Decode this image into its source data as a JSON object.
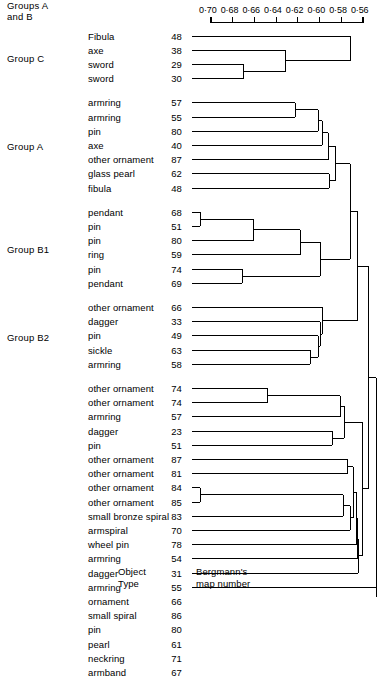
{
  "chart_data": {
    "type": "dendrogram",
    "title": "",
    "xlabel": "",
    "ylabel": "",
    "axis": {
      "position": "top",
      "ticks": [
        "0·70",
        "0·68",
        "0·66",
        "0·64",
        "0·62",
        "0·60",
        "0·58",
        "0·56"
      ],
      "values": [
        0.7,
        0.68,
        0.66,
        0.64,
        0.62,
        0.6,
        0.58,
        0.56
      ],
      "range": [
        0.7,
        0.56
      ],
      "direction": "decreasing-left-to-right",
      "grid": false
    },
    "column_headers": {
      "object_type": "Object\nType",
      "map_number": "Bergmann's\nmap number"
    },
    "group_labels": [
      {
        "text": "Group C",
        "rows": [
          0,
          3
        ]
      },
      {
        "text": "Group A",
        "rows": [
          4,
          10
        ]
      },
      {
        "text": "Group B1",
        "rows": [
          11,
          16
        ]
      },
      {
        "text": "Group B2",
        "rows": [
          17,
          21
        ]
      },
      {
        "text": "Groups A\nand B",
        "rows": [
          22,
          45
        ]
      }
    ],
    "leaves": [
      {
        "type": "Fibula",
        "map": "48"
      },
      {
        "type": "axe",
        "map": "38"
      },
      {
        "type": "sword",
        "map": "29"
      },
      {
        "type": "sword",
        "map": "30"
      },
      {
        "type": "armring",
        "map": "57"
      },
      {
        "type": "armring",
        "map": "55"
      },
      {
        "type": "pin",
        "map": "80"
      },
      {
        "type": "axe",
        "map": "40"
      },
      {
        "type": "other ornament",
        "map": "87"
      },
      {
        "type": "glass pearl",
        "map": "62"
      },
      {
        "type": "fibula",
        "map": "48"
      },
      {
        "type": "pendant",
        "map": "68"
      },
      {
        "type": "pin",
        "map": "51"
      },
      {
        "type": "pin",
        "map": "80"
      },
      {
        "type": "ring",
        "map": "59"
      },
      {
        "type": "pin",
        "map": "74"
      },
      {
        "type": "pendant",
        "map": "69"
      },
      {
        "type": "other ornament",
        "map": "66"
      },
      {
        "type": "dagger",
        "map": "33"
      },
      {
        "type": "pin",
        "map": "49"
      },
      {
        "type": "sickle",
        "map": "63"
      },
      {
        "type": "armring",
        "map": "58"
      },
      {
        "type": "other ornament",
        "map": "74"
      },
      {
        "type": "other ornament",
        "map": "74"
      },
      {
        "type": "armring",
        "map": "57"
      },
      {
        "type": "dagger",
        "map": "23"
      },
      {
        "type": "pin",
        "map": "51"
      },
      {
        "type": "other ornament",
        "map": "87"
      },
      {
        "type": "other ornament",
        "map": "81"
      },
      {
        "type": "other ornament",
        "map": "84"
      },
      {
        "type": "other ornament",
        "map": "85"
      },
      {
        "type": "small bronze spiral",
        "map": "83"
      },
      {
        "type": "armspiral",
        "map": "70"
      },
      {
        "type": "wheel pin",
        "map": "78"
      },
      {
        "type": "armring",
        "map": "54"
      },
      {
        "type": "dagger",
        "map": "31"
      },
      {
        "type": "armring",
        "map": "55"
      },
      {
        "type": "ornament",
        "map": "66"
      },
      {
        "type": "small spiral",
        "map": "86"
      },
      {
        "type": "pin",
        "map": "80"
      },
      {
        "type": "pearl",
        "map": "61"
      },
      {
        "type": "neckring",
        "map": "71"
      },
      {
        "type": "armband",
        "map": "67"
      }
    ],
    "merges": [
      {
        "children": [
          2,
          3
        ],
        "x": 243
      },
      {
        "children": [
          1,
          "m0"
        ],
        "x": 285
      },
      {
        "children": [
          0,
          "m1"
        ],
        "x": 350
      },
      {
        "children": [
          4,
          5
        ],
        "x": 295
      },
      {
        "children": [
          6,
          "m3"
        ],
        "x": 318
      },
      {
        "children": [
          7,
          "m4"
        ],
        "x": 322
      },
      {
        "children": [
          8,
          "m5"
        ],
        "x": 328
      },
      {
        "children": [
          9,
          10
        ],
        "x": 329
      },
      {
        "children": [
          "m6",
          "m7"
        ],
        "x": 335
      },
      {
        "children": [
          11,
          12
        ],
        "x": 200
      },
      {
        "children": [
          13,
          "m9"
        ],
        "x": 253
      },
      {
        "children": [
          14,
          "m10"
        ],
        "x": 300
      },
      {
        "children": [
          15,
          16
        ],
        "x": 242
      },
      {
        "children": [
          "m11",
          "m12"
        ],
        "x": 320
      },
      {
        "children": [
          "m8",
          "m13"
        ],
        "x": 350
      },
      {
        "children": [
          20,
          21
        ],
        "x": 310
      },
      {
        "children": [
          19,
          "m15"
        ],
        "x": 318
      },
      {
        "children": [
          18,
          "m16"
        ],
        "x": 320
      },
      {
        "children": [
          17,
          "m17"
        ],
        "x": 322
      },
      {
        "children": [
          "m14",
          "m18"
        ],
        "x": 357
      },
      {
        "children": [
          22,
          23
        ],
        "x": 267
      },
      {
        "children": [
          24,
          "m20"
        ],
        "x": 340
      },
      {
        "children": [
          25,
          26
        ],
        "x": 332
      },
      {
        "children": [
          "m21",
          "m22"
        ],
        "x": 344
      },
      {
        "children": [
          27,
          28
        ],
        "x": 347
      },
      {
        "children": [
          29,
          30
        ],
        "x": 200
      },
      {
        "children": [
          31,
          "m25"
        ],
        "x": 343
      },
      {
        "children": [
          32,
          "m26"
        ],
        "x": 350
      },
      {
        "children": [
          "m24",
          "m27"
        ],
        "x": 353
      },
      {
        "children": [
          33,
          "m28"
        ],
        "x": 356
      },
      {
        "children": [
          34,
          "m29"
        ],
        "x": 357
      },
      {
        "children": [
          35,
          "m30"
        ],
        "x": 358
      },
      {
        "children": [
          "m23",
          "m31"
        ],
        "x": 362
      },
      {
        "children": [
          "m19",
          "m32"
        ],
        "x": 368
      },
      {
        "children": [
          36,
          37,
          38,
          39,
          40,
          41,
          42,
          "m33"
        ],
        "x": 376
      }
    ],
    "colors": {
      "line": "#000000",
      "background": "#ffffff"
    }
  }
}
